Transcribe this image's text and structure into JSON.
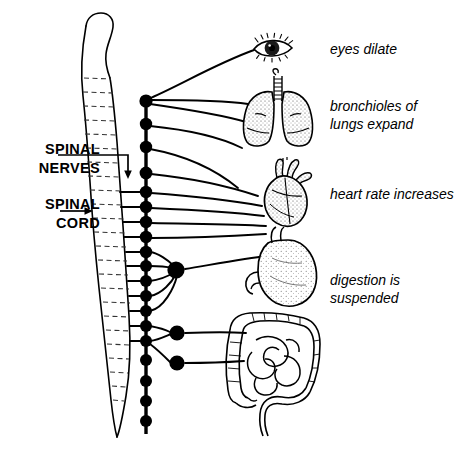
{
  "figure": {
    "background_color": "#ffffff",
    "line_color": "#000000"
  },
  "left_labels": [
    {
      "name": "spinal-nerves",
      "text": "SPINAL\nNERVES",
      "x": 8,
      "y": 140,
      "width": 92
    },
    {
      "name": "spinal-cord",
      "text": "SPINAL\nCORD",
      "x": 8,
      "y": 195,
      "width": 92
    }
  ],
  "right_labels": [
    {
      "name": "eyes-dilate",
      "text": "eyes dilate",
      "x": 330,
      "y": 41
    },
    {
      "name": "bronchioles-of-lungs-expand",
      "text": "bronchioles of\nlungs expand",
      "x": 330,
      "y": 98
    },
    {
      "name": "heart-rate-increases",
      "text": "heart rate increases",
      "x": 330,
      "y": 186
    },
    {
      "name": "digestion-is-suspended",
      "text": "digestion is\nsuspended",
      "x": 330,
      "y": 272
    }
  ],
  "organs": [
    {
      "name": "eye",
      "label": "eye",
      "cx": 272,
      "cy": 48
    },
    {
      "name": "lungs",
      "label": "lungs",
      "cx": 278,
      "cy": 110
    },
    {
      "name": "heart",
      "label": "heart",
      "cx": 285,
      "cy": 192
    },
    {
      "name": "stomach",
      "label": "stomach",
      "cx": 285,
      "cy": 275
    },
    {
      "name": "intestines",
      "label": "intestines",
      "cx": 280,
      "cy": 360
    }
  ],
  "structures": {
    "spinal_cord": {
      "name": "spinal-cord-column",
      "segments": 24,
      "top_y": 22,
      "bottom_y": 437
    },
    "sympathetic_chain": {
      "name": "sympathetic-chain",
      "x": 146,
      "top_y": 101,
      "bottom_y": 434,
      "ganglia_count": 19
    },
    "prevertebral_ganglia": [
      {
        "name": "celiac-ganglion",
        "cx": 176,
        "cy": 270,
        "r": 8.5
      },
      {
        "name": "superior-mesenteric-ganglion",
        "cx": 177,
        "cy": 333,
        "r": 7.5
      },
      {
        "name": "inferior-mesenteric-ganglion",
        "cx": 177,
        "cy": 363,
        "r": 7.5
      }
    ]
  }
}
